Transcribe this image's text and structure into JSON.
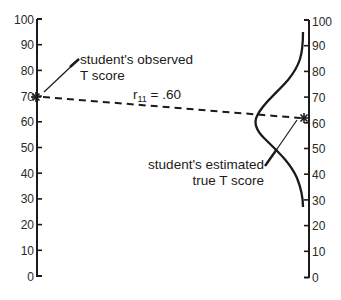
{
  "diagram": {
    "left_axis": {
      "label": "observed T score scale",
      "min": 0,
      "max": 100,
      "step": 10,
      "ticks": [
        "0",
        "10",
        "20",
        "30",
        "40",
        "50",
        "60",
        "70",
        "80",
        "90",
        "100"
      ]
    },
    "right_axis": {
      "label": "true T score scale",
      "min": 0,
      "max": 100,
      "step": 10,
      "ticks": [
        "0",
        "10",
        "20",
        "30",
        "40",
        "50",
        "60",
        "70",
        "80",
        "90",
        "100"
      ]
    },
    "observed_point": {
      "value": 70,
      "marker": "asterisk"
    },
    "estimated_point": {
      "value": 62,
      "marker": "asterisk"
    },
    "regression_line": {
      "style": "dashed",
      "label": "r₁₁ = .60",
      "label_main": "r",
      "label_sub": "11",
      "label_rest": " = .60"
    },
    "distribution": {
      "type": "normal-curve",
      "center": 62,
      "range": [
        30,
        96
      ]
    },
    "annotations": {
      "observed_line1": "student's observed",
      "observed_line2": "T score",
      "estimated_line1": "student's estimated",
      "estimated_line2": "true T score"
    },
    "colors": {
      "ink": "#1a1a1a",
      "background": "#ffffff"
    }
  }
}
